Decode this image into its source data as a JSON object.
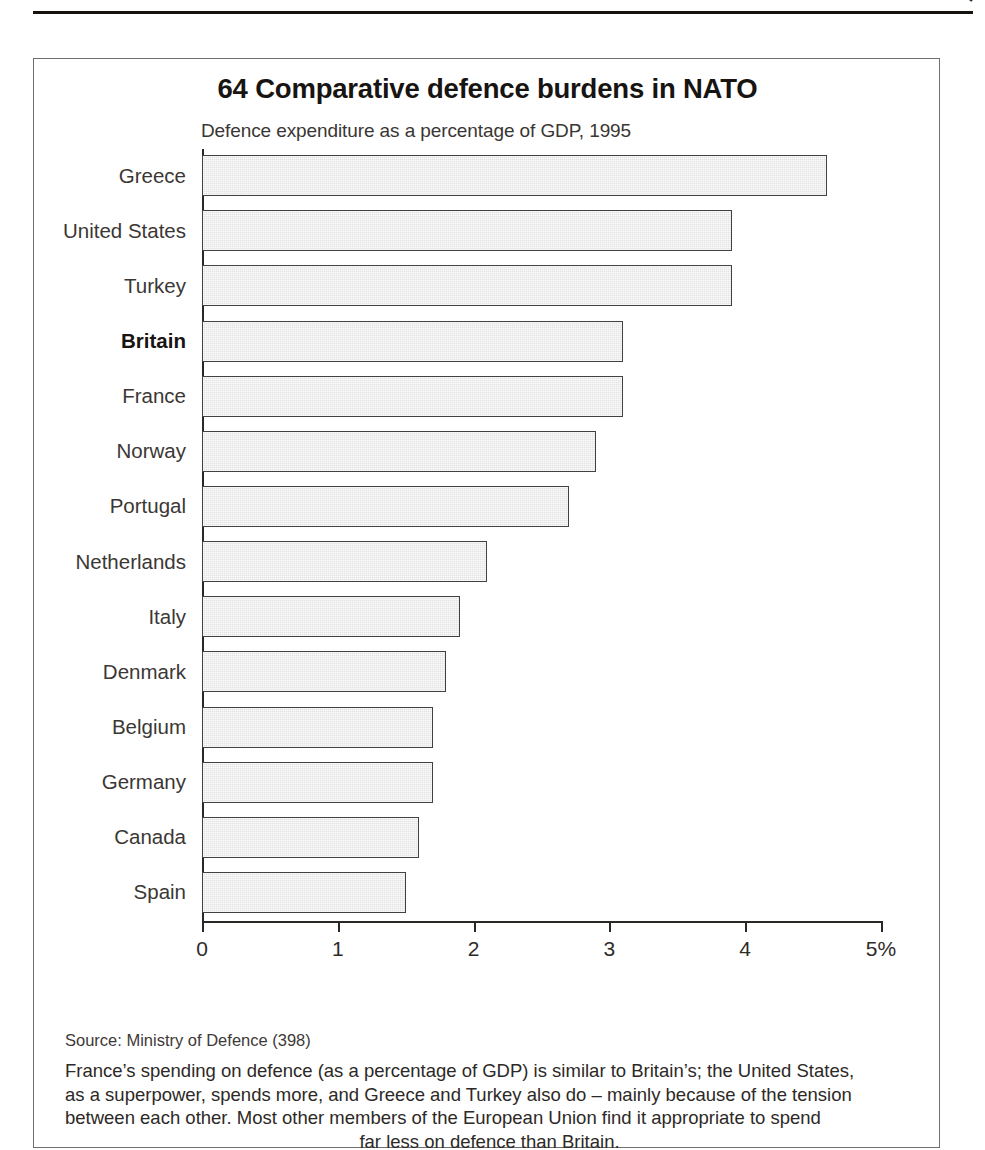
{
  "page": {
    "top_rule": true,
    "corner_mark": "page-corner-mark"
  },
  "figure": {
    "number": "64",
    "title": "64 Comparative defence burdens in NATO",
    "subtitle": "Defence expenditure as a percentage of GDP, 1995",
    "source_note": "Source: Ministry of Defence (398)",
    "caption_lines": [
      "France’s spending on defence (as a percentage of GDP) is similar to Britain’s; the United States,",
      "as a superpower, spends more, and Greece and Turkey also do – mainly because of the tension",
      "between each other. Most other members of the European Union find it appropriate to spend",
      "far less on defence than Britain."
    ],
    "caption_full": "France’s spending on defence (as a percentage of GDP) is similar to Britain’s; the United States, as a superpower, spends more, and Greece and Turkey also do – mainly because of the tension between each other. Most other members of the European Union find it appropriate to spend far less on defence than Britain."
  },
  "colors": {
    "bar_fill": "#e4e4e4",
    "bar_border": "#44403e",
    "axis": "#2b2725",
    "frame": "#6f6f6f",
    "text": "#2d2926",
    "highlight_text": "#171412"
  },
  "chart_data": {
    "type": "bar",
    "orientation": "horizontal",
    "title": "64 Comparative defence burdens in NATO",
    "subtitle": "Defence expenditure as a percentage of GDP, 1995",
    "xlabel": "",
    "ylabel": "",
    "xlim": [
      0,
      5
    ],
    "grid": false,
    "legend": false,
    "unit": "%",
    "tick_labels": [
      "0",
      "1",
      "2",
      "3",
      "4",
      "5%"
    ],
    "tick_values": [
      0,
      1,
      2,
      3,
      4,
      5
    ],
    "categories": [
      "Greece",
      "United States",
      "Turkey",
      "Britain",
      "France",
      "Norway",
      "Portugal",
      "Netherlands",
      "Italy",
      "Denmark",
      "Belgium",
      "Germany",
      "Canada",
      "Spain"
    ],
    "values": [
      4.6,
      3.9,
      3.9,
      3.1,
      3.1,
      2.9,
      2.7,
      2.1,
      1.9,
      1.8,
      1.7,
      1.7,
      1.6,
      1.5
    ],
    "highlighted_category": "Britain"
  }
}
